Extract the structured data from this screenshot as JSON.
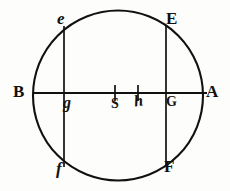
{
  "figure": {
    "kind": "geometric-diagram",
    "background_color": "#fdfdfb",
    "ink_color": "#111111",
    "geometry": {
      "circle": {
        "cx": 118,
        "cy": 95.5,
        "r": 85
      },
      "diameter_line": {
        "x1": 33,
        "y1": 93,
        "x2": 207,
        "y2": 93
      },
      "chord_left": {
        "x": 64,
        "y1": 27,
        "y2": 166
      },
      "chord_right": {
        "x": 166,
        "y1": 27,
        "y2": 166
      },
      "tick_S": {
        "x": 115,
        "y1": 86,
        "y2": 100
      },
      "tick_h": {
        "x": 138,
        "y1": 86,
        "y2": 100
      }
    },
    "labels": [
      {
        "id": "e",
        "text": "e",
        "style": "italic",
        "x": 57,
        "y": 10
      },
      {
        "id": "E",
        "text": "E",
        "style": "capital",
        "x": 166,
        "y": 10
      },
      {
        "id": "B",
        "text": "B",
        "style": "capital",
        "x": 13,
        "y": 83
      },
      {
        "id": "A",
        "text": "A",
        "style": "capital",
        "x": 206,
        "y": 83
      },
      {
        "id": "g",
        "text": "g",
        "style": "italic-small",
        "x": 63,
        "y": 95
      },
      {
        "id": "S",
        "text": "S",
        "style": "capital-small",
        "x": 111,
        "y": 97
      },
      {
        "id": "h",
        "text": "h",
        "style": "italic-small",
        "x": 134,
        "y": 93
      },
      {
        "id": "G",
        "text": "G",
        "style": "capital-small",
        "x": 166,
        "y": 95
      },
      {
        "id": "f",
        "text": "f",
        "style": "italic",
        "x": 56,
        "y": 160
      },
      {
        "id": "F",
        "text": "F",
        "style": "capital",
        "x": 164,
        "y": 158
      }
    ]
  }
}
